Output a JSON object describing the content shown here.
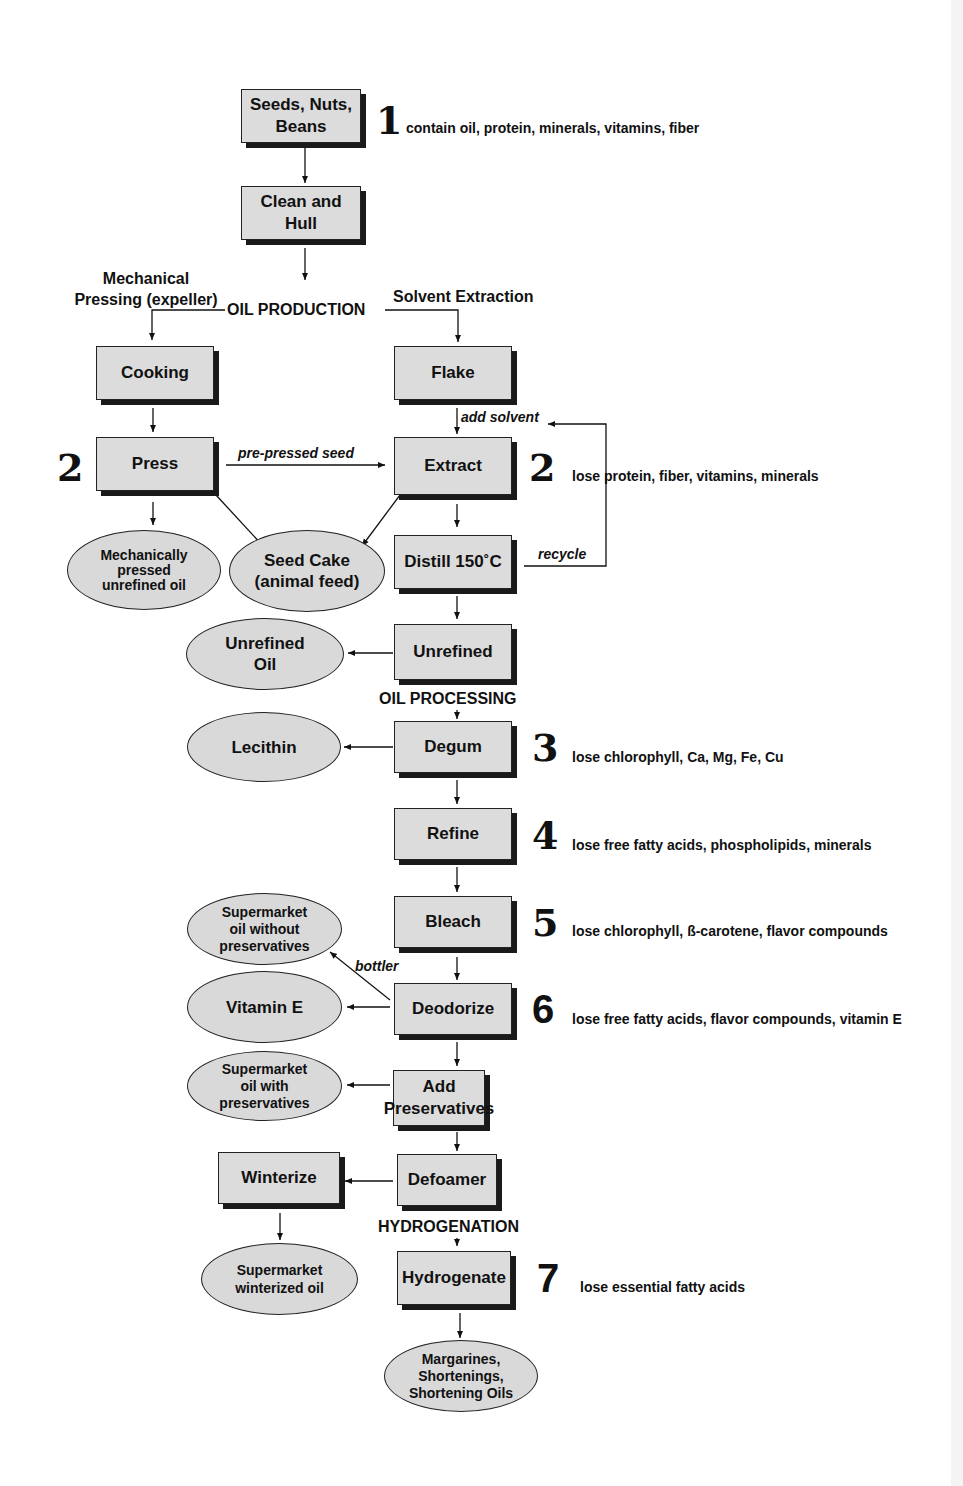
{
  "diagram": {
    "sections": {
      "oil_production": "OIL PRODUCTION",
      "oil_processing": "OIL PROCESSING",
      "hydrogenation": "HYDROGENATION"
    },
    "branches": {
      "mechanical": [
        "Mechanical",
        "Pressing (expeller)"
      ],
      "solvent": "Solvent Extraction"
    },
    "process_boxes": {
      "seeds": [
        "Seeds, Nuts,",
        "Beans"
      ],
      "clean": [
        "Clean and",
        "Hull"
      ],
      "cooking": "Cooking",
      "flake": "Flake",
      "press": "Press",
      "extract": "Extract",
      "distill": "Distill 150˚C",
      "unrefined": "Unrefined",
      "degum": "Degum",
      "refine": "Refine",
      "bleach": "Bleach",
      "deodorize": "Deodorize",
      "add_preservatives": [
        "Add",
        "Preservatives"
      ],
      "defoamer": "Defoamer",
      "winterize": "Winterize",
      "hydrogenate": "Hydrogenate"
    },
    "products": {
      "mech_oil": [
        "Mechanically",
        "pressed",
        "unrefined oil"
      ],
      "seed_cake": [
        "Seed Cake",
        "(animal feed)"
      ],
      "unrefined_oil": [
        "Unrefined",
        "Oil"
      ],
      "lecithin": "Lecithin",
      "no_preservatives": [
        "Supermarket",
        "oil without",
        "preservatives"
      ],
      "vitamin_e": "Vitamin E",
      "with_preservatives": [
        "Supermarket",
        "oil with",
        "preservatives"
      ],
      "winterized": [
        "Supermarket",
        "winterized oil"
      ],
      "margarines": [
        "Margarines,",
        "Shortenings,",
        "Shortening Oils"
      ]
    },
    "edge_labels": {
      "pre_pressed": "pre-pressed seed",
      "add_solvent": "add solvent",
      "recycle": "recycle",
      "bottler": "bottler"
    },
    "steps": [
      {
        "num": "1",
        "note": "contain oil, protein, minerals, vitamins, fiber"
      },
      {
        "num": "2",
        "note": ""
      },
      {
        "num": "2",
        "note": "lose protein, fiber, vitamins, minerals"
      },
      {
        "num": "3",
        "note": "lose chlorophyll, Ca, Mg, Fe, Cu"
      },
      {
        "num": "4",
        "note": "lose free fatty acids, phospholipids, minerals"
      },
      {
        "num": "5",
        "note": "lose chlorophyll, ß-carotene, flavor compounds"
      },
      {
        "num": "6",
        "note": "lose free fatty acids, flavor compounds, vitamin E"
      },
      {
        "num": "7",
        "note": "lose essential fatty acids"
      }
    ]
  }
}
